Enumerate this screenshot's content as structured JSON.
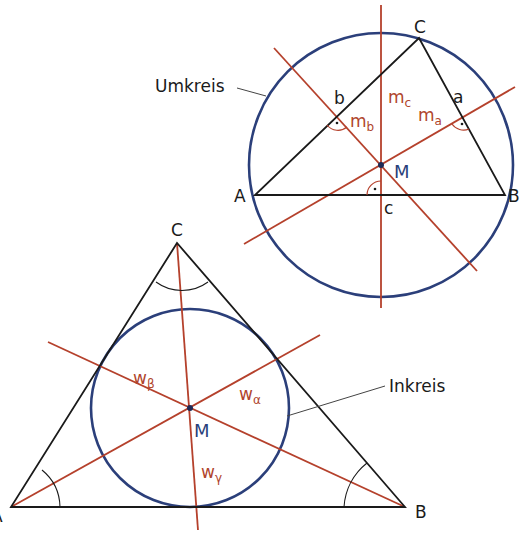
{
  "colors": {
    "triangle": "#1a1a1a",
    "lines": "#b5412c",
    "circle": "#2b3f7a",
    "label_red": "#b0452c",
    "label_blue": "#2b3f7a",
    "background": "#ffffff"
  },
  "umkreis_figure": {
    "title": "Umkreis",
    "vertices": {
      "A": "A",
      "B": "B",
      "C": "C"
    },
    "sides": {
      "a": "a",
      "b": "b",
      "c": "c"
    },
    "bisectors": [
      {
        "base": "m",
        "sub": "a"
      },
      {
        "base": "m",
        "sub": "b"
      },
      {
        "base": "m",
        "sub": "c"
      }
    ],
    "center": "M"
  },
  "inkreis_figure": {
    "title": "Inkreis",
    "vertices": {
      "A": "A",
      "B": "B",
      "C": "C"
    },
    "angle_bisectors": [
      {
        "base": "w",
        "sub": "α"
      },
      {
        "base": "w",
        "sub": "β"
      },
      {
        "base": "w",
        "sub": "γ"
      }
    ],
    "center": "M"
  }
}
